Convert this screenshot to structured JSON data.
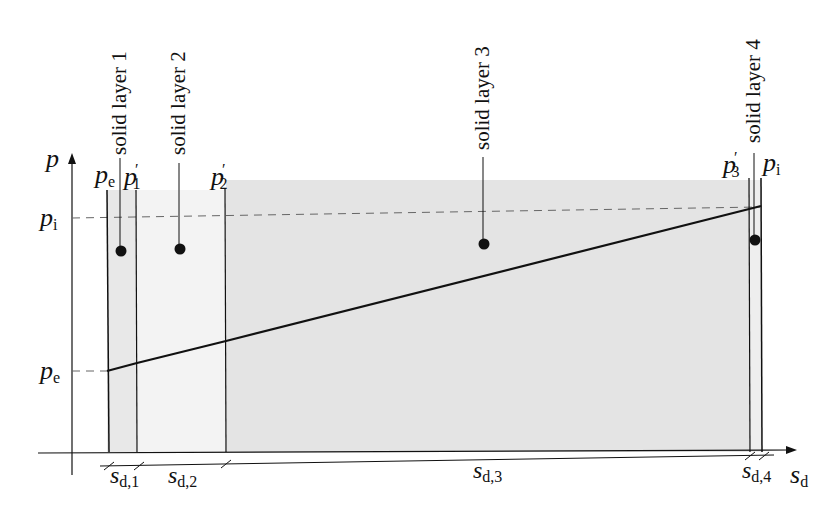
{
  "diagram": {
    "axes": {
      "y_label": "p",
      "x_label_main": "s",
      "x_label_sub": "d"
    },
    "layers": [
      {
        "name": "solid layer 1",
        "thickness_main": "s",
        "thickness_sub": "d,1"
      },
      {
        "name": "solid layer 2",
        "thickness_main": "s",
        "thickness_sub": "d,2"
      },
      {
        "name": "solid layer 3",
        "thickness_main": "s",
        "thickness_sub": "d,3"
      },
      {
        "name": "solid layer 4",
        "thickness_main": "s",
        "thickness_sub": "d,4"
      }
    ],
    "top_labels": [
      {
        "main": "p",
        "sub": "e",
        "sup": ""
      },
      {
        "main": "p",
        "sub": "1",
        "sup": "′"
      },
      {
        "main": "p",
        "sub": "2",
        "sup": "′"
      },
      {
        "main": "p",
        "sub": "3",
        "sup": "′"
      },
      {
        "main": "p",
        "sub": "i",
        "sup": ""
      }
    ],
    "left_labels": {
      "pi": {
        "main": "p",
        "sub": "i"
      },
      "pe": {
        "main": "p",
        "sub": "e"
      }
    },
    "colors": {
      "shade": "#e6e6e6",
      "line": "#111111",
      "dash": "#666666"
    }
  }
}
